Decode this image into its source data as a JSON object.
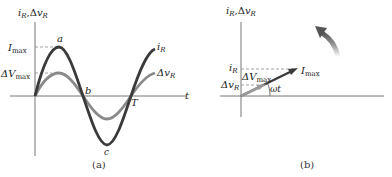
{
  "panel_a": {
    "caption": "(a)",
    "y_axis_label": {
      "i": "i",
      "i_sub": "R",
      "sep": ",Δ",
      "v": "v",
      "v_sub": "R"
    },
    "x_axis_label": "t",
    "imax_label": {
      "main": "I",
      "sub": "max"
    },
    "vmax_label": {
      "main": "ΔV",
      "sub": "max"
    },
    "point_a": "a",
    "point_b": "b",
    "point_c": "c",
    "period_label": "T",
    "curve_i_label": {
      "main": "i",
      "sub": "R"
    },
    "curve_v_label": {
      "main": "Δv",
      "sub": "R"
    }
  },
  "panel_b": {
    "caption": "(b)",
    "y_axis_label": {
      "i": "i",
      "i_sub": "R",
      "sep": ",Δ",
      "v": "v",
      "v_sub": "R"
    },
    "iR_label": {
      "main": "i",
      "sub": "R"
    },
    "vR_label": {
      "main": "Δv",
      "sub": "R"
    },
    "vmax_label": {
      "main": "ΔV",
      "sub": "max"
    },
    "imax_label": {
      "main": "I",
      "sub": "max"
    },
    "angle_label": "ωt",
    "rotation_arrow": "counterclockwise-rotation-arrow"
  },
  "colors": {
    "current_curve": "#3a3a3a",
    "voltage_curve": "#8a8a8a",
    "axis": "#777777",
    "dashed": "#888888"
  }
}
